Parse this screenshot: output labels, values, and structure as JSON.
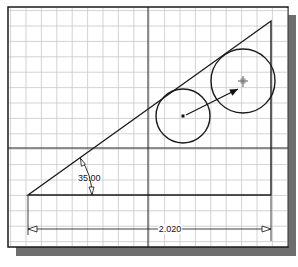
{
  "drawing": {
    "frame": {
      "x": 8,
      "y": 7,
      "width": 280,
      "height": 240
    },
    "shadow_color": "#6e6e6e",
    "grid": {
      "spacing": 15.4,
      "origin_x": 10.6,
      "origin_y": 10.6,
      "color": "#c8c8c8"
    },
    "axes": {
      "x_axis_y": 148,
      "y_axis_x": 148,
      "color": "#222222"
    },
    "triangle": {
      "points": [
        [
          28,
          195
        ],
        [
          271,
          21
        ],
        [
          271,
          195
        ]
      ],
      "color": "#1a1a1a"
    },
    "circles": [
      {
        "name": "small-circle",
        "cx": 183,
        "cy": 116,
        "r": 27
      },
      {
        "name": "large-circle",
        "cx": 243,
        "cy": 81,
        "r": 32
      }
    ],
    "drag_arrow": {
      "x1": 186,
      "y1": 115,
      "x2": 238,
      "y2": 89
    },
    "angle_dimension": {
      "label": "35.00",
      "label_x": 78,
      "label_y": 181,
      "vertex": [
        28,
        195
      ]
    },
    "linear_dimension": {
      "label": "2.020",
      "y": 229,
      "x1": 28,
      "x2": 271,
      "label_x": 170
    }
  }
}
